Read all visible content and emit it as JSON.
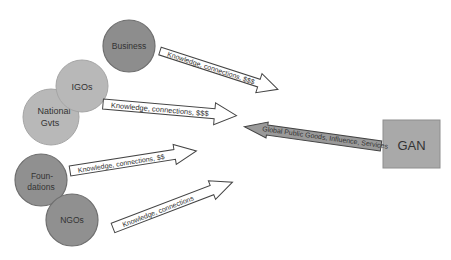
{
  "colors": {
    "business_fill": "#8d8d8d",
    "light_fill": "#b8b8b8",
    "medium_fill": "#909090",
    "circle_stroke": "#6e6e6e",
    "gan_fill": "#a9a9a9",
    "arrow_stroke": "#444444",
    "gan_arrow_fill": "#9a9a9a"
  },
  "nodes": {
    "business": {
      "label": "Business"
    },
    "igos": {
      "label": "IGOs"
    },
    "national_gvts": {
      "line1": "National",
      "line2": "Gvts"
    },
    "foundations": {
      "line1": "Foun-",
      "line2": "dations"
    },
    "ngos": {
      "label": "NGOs"
    },
    "gan": {
      "label": "GAN"
    }
  },
  "arrows": {
    "business_to_gan": {
      "label": "Knowledge, connections, $$$"
    },
    "igos_to_gan": {
      "label": "Knowledge, connections, $$$"
    },
    "gan_to_stakeholders": {
      "label": "Global Public Goods, Influence, Services"
    },
    "foundations_to_gan": {
      "label": "Knowledge, connections, $$"
    },
    "ngos_to_gan": {
      "label": "Knowledge, connections"
    }
  }
}
